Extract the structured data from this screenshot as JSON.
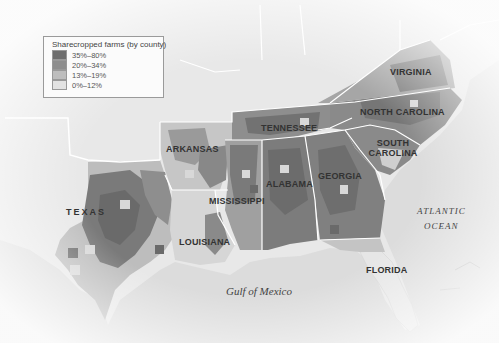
{
  "legend": {
    "title": "Sharecropped farms (by county)",
    "items": [
      {
        "label": "35%–80%",
        "color": "#6e6e6e"
      },
      {
        "label": "20%–34%",
        "color": "#8e8e8e"
      },
      {
        "label": "13%–19%",
        "color": "#bdbdbd"
      },
      {
        "label": "0%–12%",
        "color": "#e2e2e2"
      }
    ]
  },
  "states": [
    {
      "name": "VIRGINIA",
      "x": 420,
      "y": 72
    },
    {
      "name": "NORTH CAROLINA",
      "x": 402,
      "y": 112
    },
    {
      "name": "TENNESSEE",
      "x": 290,
      "y": 128
    },
    {
      "name": "SOUTH CAROLINA",
      "x": 392,
      "y": 150
    },
    {
      "name": "ARKANSAS",
      "x": 192,
      "y": 149
    },
    {
      "name": "GEORGIA",
      "x": 341,
      "y": 176
    },
    {
      "name": "ALABAMA",
      "x": 289,
      "y": 184
    },
    {
      "name": "TEXAS",
      "x": 86,
      "y": 212
    },
    {
      "name": "MISSISSIPPI",
      "x": 238,
      "y": 201
    },
    {
      "name": "LOUISIANA",
      "x": 205,
      "y": 242
    },
    {
      "name": "FLORIDA",
      "x": 387,
      "y": 270
    }
  ],
  "water": [
    {
      "name": "ATLANTIC",
      "x": 442,
      "y": 212,
      "size": 9
    },
    {
      "name": "OCEAN",
      "x": 442,
      "y": 226,
      "size": 9
    },
    {
      "name": "Gulf of Mexico",
      "x": 261,
      "y": 292,
      "size": 11
    }
  ],
  "map_colors": {
    "land": "#e6e6e6",
    "water": "#d9d9d9",
    "border": "#ffffff",
    "high": "#6e6e6e",
    "mid": "#8e8e8e",
    "low": "#bdbdbd",
    "none": "#e2e2e2"
  }
}
